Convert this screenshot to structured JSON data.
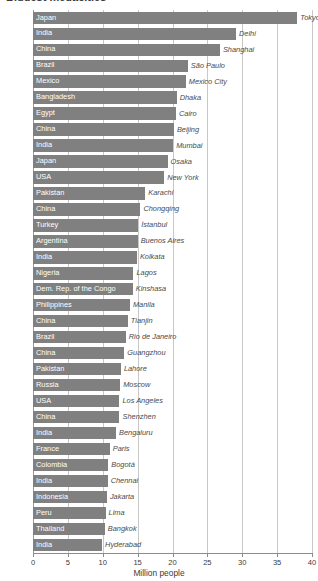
{
  "chart_data": {
    "type": "bar",
    "orientation": "horizontal",
    "title": "Biggest megacities",
    "xlabel": "Million people",
    "ylabel": "",
    "xlim": [
      0,
      40
    ],
    "xticks": [
      0,
      5,
      10,
      15,
      20,
      25,
      30,
      35,
      40
    ],
    "grid": true,
    "grid_axis": "x",
    "legend": false,
    "bar_color": "#808080",
    "country_label_color": "#ffffff",
    "city_label_color": "#4a4a4a",
    "categories": [
      "Tokyo",
      "Delhi",
      "Shanghai",
      "São Paulo",
      "Mexico City",
      "Dhaka",
      "Cairo",
      "Beijing",
      "Mumbai",
      "Osaka",
      "New York",
      "Karachi",
      "Chongqing",
      "İstanbul",
      "Buenos Aires",
      "Kolkata",
      "Lagos",
      "Kinshasa",
      "Manila",
      "Tianjin",
      "Rio de Janeiro",
      "Guangzhou",
      "Lahore",
      "Moscow",
      "Los Angeles",
      "Shenzhen",
      "Bengaluru",
      "Paris",
      "Bogotá",
      "Chennai",
      "Jakarta",
      "Lima",
      "Bangkok",
      "Hyderabad"
    ],
    "values": [
      37.9,
      29.1,
      26.8,
      22.2,
      21.9,
      20.6,
      20.5,
      20.2,
      20.1,
      19.3,
      18.8,
      16.1,
      15.4,
      15.1,
      15.0,
      14.9,
      14.4,
      14.3,
      13.9,
      13.6,
      13.3,
      13.1,
      12.6,
      12.5,
      12.4,
      12.4,
      11.9,
      11.0,
      10.8,
      10.7,
      10.6,
      10.4,
      10.3,
      9.9
    ],
    "points": [
      {
        "country": "Japan",
        "city": "Tokyo",
        "value": 37.9
      },
      {
        "country": "India",
        "city": "Delhi",
        "value": 29.1
      },
      {
        "country": "China",
        "city": "Shanghai",
        "value": 26.8
      },
      {
        "country": "Brazil",
        "city": "São Paulo",
        "value": 22.2
      },
      {
        "country": "Mexico",
        "city": "Mexico City",
        "value": 21.9
      },
      {
        "country": "Bangladesh",
        "city": "Dhaka",
        "value": 20.6
      },
      {
        "country": "Egypt",
        "city": "Cairo",
        "value": 20.5
      },
      {
        "country": "China",
        "city": "Beijing",
        "value": 20.2
      },
      {
        "country": "India",
        "city": "Mumbai",
        "value": 20.1
      },
      {
        "country": "Japan",
        "city": "Osaka",
        "value": 19.3
      },
      {
        "country": "USA",
        "city": "New York",
        "value": 18.8
      },
      {
        "country": "Pakistan",
        "city": "Karachi",
        "value": 16.1
      },
      {
        "country": "China",
        "city": "Chongqing",
        "value": 15.4
      },
      {
        "country": "Turkey",
        "city": "İstanbul",
        "value": 15.1
      },
      {
        "country": "Argentina",
        "city": "Buenos Aires",
        "value": 15.0
      },
      {
        "country": "India",
        "city": "Kolkata",
        "value": 14.9
      },
      {
        "country": "Nigeria",
        "city": "Lagos",
        "value": 14.4
      },
      {
        "country": "Dem. Rep. of the Congo",
        "city": "Kinshasa",
        "value": 14.3
      },
      {
        "country": "Philippines",
        "city": "Manila",
        "value": 13.9
      },
      {
        "country": "China",
        "city": "Tianjin",
        "value": 13.6
      },
      {
        "country": "Brazil",
        "city": "Rio de Janeiro",
        "value": 13.3
      },
      {
        "country": "China",
        "city": "Guangzhou",
        "value": 13.1
      },
      {
        "country": "Pakistan",
        "city": "Lahore",
        "value": 12.6
      },
      {
        "country": "Russia",
        "city": "Moscow",
        "value": 12.5
      },
      {
        "country": "USA",
        "city": "Los Angeles",
        "value": 12.4
      },
      {
        "country": "China",
        "city": "Shenzhen",
        "value": 12.4
      },
      {
        "country": "India",
        "city": "Bengaluru",
        "value": 11.9
      },
      {
        "country": "France",
        "city": "Paris",
        "value": 11.0
      },
      {
        "country": "Colombia",
        "city": "Bogotá",
        "value": 10.8
      },
      {
        "country": "India",
        "city": "Chennai",
        "value": 10.7
      },
      {
        "country": "Indonesia",
        "city": "Jakarta",
        "value": 10.6
      },
      {
        "country": "Peru",
        "city": "Lima",
        "value": 10.4
      },
      {
        "country": "Thailand",
        "city": "Bangkok",
        "value": 10.3
      },
      {
        "country": "India",
        "city": "Hyderabad",
        "value": 9.9
      }
    ]
  }
}
